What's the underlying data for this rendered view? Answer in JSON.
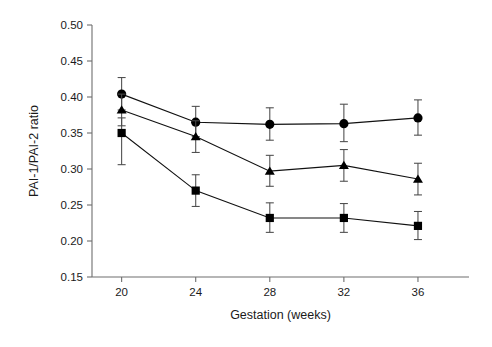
{
  "chart_data": {
    "type": "line",
    "title": "",
    "xlabel": "Gestation (weeks)",
    "ylabel": "PAI-1/PAI-2 ratio",
    "x": [
      20,
      24,
      28,
      32,
      36
    ],
    "xtick_labels": [
      "20",
      "24",
      "28",
      "32",
      "36"
    ],
    "ytick_labels": [
      "0.15",
      "0.20",
      "0.25",
      "0.30",
      "0.35",
      "0.40",
      "0.45",
      "0.50"
    ],
    "yticks": [
      0.15,
      0.2,
      0.25,
      0.3,
      0.35,
      0.4,
      0.45,
      0.5
    ],
    "xlim": [
      18.4,
      38.0
    ],
    "ylim": [
      0.15,
      0.5
    ],
    "grid": false,
    "legend": "none",
    "series": [
      {
        "name": "circle-series",
        "marker": "circle",
        "values": [
          0.404,
          0.365,
          0.362,
          0.363,
          0.371
        ],
        "err_low": [
          0.382,
          0.345,
          0.34,
          0.338,
          0.347
        ],
        "err_high": [
          0.427,
          0.387,
          0.385,
          0.39,
          0.396
        ]
      },
      {
        "name": "triangle-series",
        "marker": "triangle",
        "values": [
          0.382,
          0.345,
          0.297,
          0.305,
          0.286
        ],
        "err_low": [
          0.36,
          0.323,
          0.276,
          0.283,
          0.264
        ],
        "err_high": [
          0.404,
          0.367,
          0.319,
          0.327,
          0.308
        ]
      },
      {
        "name": "square-series",
        "marker": "square",
        "values": [
          0.35,
          0.27,
          0.232,
          0.232,
          0.221
        ],
        "err_low": [
          0.306,
          0.248,
          0.212,
          0.212,
          0.202
        ],
        "err_high": [
          0.371,
          0.292,
          0.253,
          0.252,
          0.241
        ]
      }
    ]
  },
  "colors": {
    "marker": "#000000",
    "line": "#111111",
    "axis": "#6e6e6e",
    "error_bar": "#4a4a4a",
    "background": "#ffffff"
  }
}
